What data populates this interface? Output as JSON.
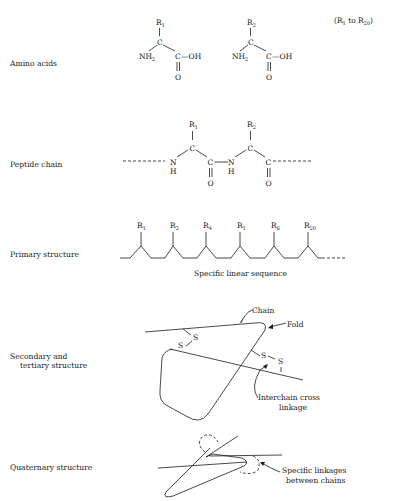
{
  "rows": {
    "amino_acids": {
      "label": "Amino acids",
      "range_note_prefix": "(R",
      "range_note_sub1": "1",
      "range_note_mid": " to R",
      "range_note_sub2": "20",
      "range_note_suffix": ")",
      "molecules": [
        {
          "r": "R",
          "r_sub": "1",
          "c": "C",
          "nh2": "NH",
          "nh2_sub": "2",
          "carboxyl_c": "C",
          "oh": "—OH",
          "o": "O"
        },
        {
          "r": "R",
          "r_sub": "2",
          "c": "C",
          "nh2": "NH",
          "nh2_sub": "2",
          "carboxyl_c": "C",
          "oh": "—OH",
          "o": "O"
        }
      ]
    },
    "peptide_chain": {
      "label": "Peptide chain",
      "residues": [
        {
          "r": "R",
          "r_sub": "1",
          "n": "N",
          "h": "H",
          "c_alpha": "C",
          "c_carbonyl": "C",
          "o": "O"
        },
        {
          "r": "R",
          "r_sub": "2",
          "n": "N",
          "h": "H",
          "c_alpha": "C",
          "c_carbonyl": "C",
          "o": "O"
        }
      ]
    },
    "primary": {
      "label": "Primary structure",
      "caption": "Specific linear sequence",
      "side_chains": [
        {
          "r": "R",
          "sub": "1"
        },
        {
          "r": "R",
          "sub": "2"
        },
        {
          "r": "R",
          "sub": "4"
        },
        {
          "r": "R",
          "sub": "1"
        },
        {
          "r": "R",
          "sub": "6"
        },
        {
          "r": "R",
          "sub": "20"
        }
      ]
    },
    "secondary_tertiary": {
      "label_line1": "Secondary and",
      "label_line2": "tertiary structure",
      "annotations": {
        "chain": "Chain",
        "fold": "Fold",
        "cross_linkage_line1": "Interchain cross",
        "cross_linkage_line2": "linkage"
      },
      "sulfur": "S"
    },
    "quaternary": {
      "label": "Quaternary structure",
      "annotation_line1": "Specific linkages",
      "annotation_line2": "between chains"
    }
  }
}
